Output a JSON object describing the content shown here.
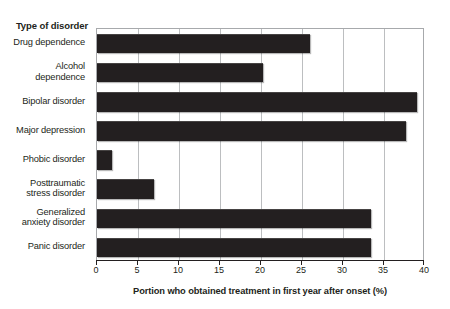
{
  "chart_data": {
    "type": "bar",
    "orientation": "horizontal",
    "title": "",
    "xlabel": "Portion who obtained treatment in first year after onset (%)",
    "ylabel": "Type of disorder",
    "xlim": [
      0,
      40
    ],
    "xticks": [
      0,
      5,
      10,
      15,
      20,
      25,
      30,
      35,
      40
    ],
    "xtick_labels": [
      "0",
      "5",
      "10",
      "15",
      "20",
      "25",
      "30",
      "35",
      "40"
    ],
    "grid": "vertical",
    "legend": "none",
    "bar_color": "#231f20",
    "categories": [
      "Drug dependence",
      "Alcohol dependence",
      "Bipolar disorder",
      "Major depression",
      "Phobic disorder",
      "Posttraumatic stress disorder",
      "Generalized anxiety disorder",
      "Panic disorder"
    ],
    "category_lines": [
      [
        "Drug dependence"
      ],
      [
        "Alcohol",
        "dependence"
      ],
      [
        "Bipolar disorder"
      ],
      [
        "Major depression"
      ],
      [
        "Phobic disorder"
      ],
      [
        "Posttraumatic",
        "stress disorder"
      ],
      [
        "Generalized",
        "anxiety disorder"
      ],
      [
        "Panic disorder"
      ]
    ],
    "values": [
      26,
      20.2,
      39,
      37.7,
      1.8,
      7,
      33.4,
      33.4
    ]
  }
}
